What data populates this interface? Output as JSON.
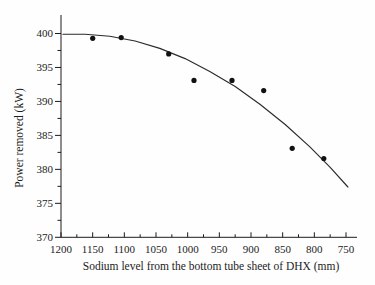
{
  "chart_data": {
    "type": "scatter",
    "title": "",
    "xlabel": "Sodium level from the bottom tube sheet of DHX (mm)",
    "ylabel": "Power removed (kW)",
    "x_reversed": true,
    "xlim": [
      1200,
      750
    ],
    "ylim": [
      370,
      400
    ],
    "x_ticks": [
      1200,
      1150,
      1100,
      1050,
      1000,
      950,
      900,
      850,
      800,
      750
    ],
    "x_minor_step": 25,
    "y_ticks": [
      370,
      375,
      380,
      385,
      390,
      395,
      400
    ],
    "y_minor_step": 2.5,
    "grid": false,
    "legend": "none",
    "points": [
      [
        1150,
        399.3
      ],
      [
        1105,
        399.4
      ],
      [
        1030,
        397.0
      ],
      [
        990,
        393.1
      ],
      [
        930,
        393.1
      ],
      [
        880,
        391.6
      ],
      [
        835,
        383.1
      ],
      [
        785,
        381.6
      ]
    ],
    "fit_curve": [
      [
        1197,
        399.9
      ],
      [
        1162,
        399.9
      ],
      [
        1123,
        399.6
      ],
      [
        1083,
        398.9
      ],
      [
        1044,
        397.8
      ],
      [
        1004,
        396.3
      ],
      [
        965,
        394.4
      ],
      [
        925,
        392.2
      ],
      [
        886,
        389.6
      ],
      [
        846,
        386.6
      ],
      [
        807,
        383.3
      ],
      [
        775,
        380.3
      ],
      [
        747,
        377.4
      ]
    ],
    "marker_color": "#111111",
    "curve_color": "#2b2b2b",
    "axis_color": "#1c1c1c",
    "background_color": "#fefefe"
  }
}
